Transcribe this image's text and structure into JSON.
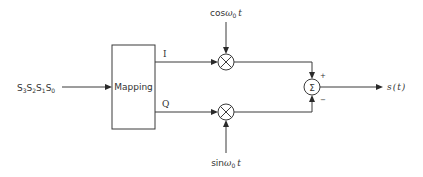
{
  "diagram": {
    "input": {
      "label": "S3S2S1S0",
      "parts": [
        {
          "base": "S",
          "sub": "3"
        },
        {
          "base": "S",
          "sub": "2"
        },
        {
          "base": "S",
          "sub": "1"
        },
        {
          "base": "S",
          "sub": "0"
        }
      ]
    },
    "mapping_block": {
      "label": "Mapping"
    },
    "branches": {
      "i": {
        "label": "I"
      },
      "q": {
        "label": "Q"
      }
    },
    "carriers": {
      "cos": {
        "func": "cos",
        "omega": "ω",
        "sub": "0",
        "var": "t",
        "full": "cosω0t"
      },
      "sin": {
        "func": "sin",
        "omega": "ω",
        "sub": "0",
        "var": "t",
        "full": "sinω0t"
      }
    },
    "multiplier_symbol": "⊗",
    "summer": {
      "symbol": "Σ",
      "plus": "+",
      "minus": "−"
    },
    "output": {
      "label": "s(t)",
      "func": "s",
      "open": "(",
      "var": "t",
      "close": ")"
    },
    "colors": {
      "stroke": "#3a3a3a",
      "text": "#333333",
      "background": "#ffffff"
    }
  }
}
